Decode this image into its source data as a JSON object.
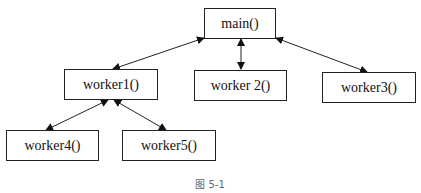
{
  "diagram": {
    "nodes": [
      {
        "id": "main",
        "label": "main()"
      },
      {
        "id": "worker1",
        "label": "worker1()"
      },
      {
        "id": "worker2",
        "label": "worker 2()"
      },
      {
        "id": "worker3",
        "label": "worker3()"
      },
      {
        "id": "worker4",
        "label": "worker4()"
      },
      {
        "id": "worker5",
        "label": "worker5()"
      }
    ],
    "edges": [
      {
        "from": "main",
        "to": "worker1",
        "style": "bidirectional-arrow"
      },
      {
        "from": "main",
        "to": "worker2",
        "style": "bidirectional-arrow"
      },
      {
        "from": "main",
        "to": "worker3",
        "style": "bidirectional-arrow"
      },
      {
        "from": "worker1",
        "to": "worker4",
        "style": "bidirectional-arrow"
      },
      {
        "from": "worker1",
        "to": "worker5",
        "style": "bidirectional-arrow"
      }
    ],
    "caption": "图 5-1"
  }
}
